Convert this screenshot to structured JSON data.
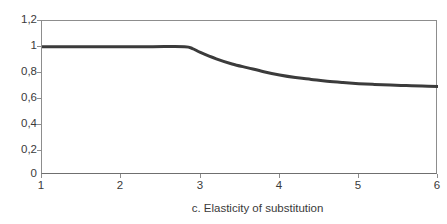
{
  "chart_data": {
    "type": "line",
    "title": "",
    "caption": "c. Elasticity of substitution",
    "xlabel": "c. Elasticity of substitution",
    "ylabel": "",
    "xlim": [
      1,
      6
    ],
    "ylim": [
      0,
      1.2
    ],
    "grid": false,
    "legend": null,
    "x_tick_labels": [
      "1",
      "2",
      "3",
      "4",
      "5",
      "6"
    ],
    "x_tick_values": [
      1,
      2,
      3,
      4,
      5,
      6
    ],
    "y_tick_labels": [
      "0",
      "0,2",
      "0,4",
      "0,6",
      "0,8",
      "1",
      "1,2"
    ],
    "y_tick_values": [
      0,
      0.2,
      0.4,
      0.6,
      0.8,
      1.0,
      1.2
    ],
    "decimal_separator": ",",
    "series": [
      {
        "name": "",
        "color": "#3b3b3b",
        "line_width": 3,
        "x": [
          1.0,
          1.5,
          2.0,
          2.4,
          2.8,
          2.9,
          3.0,
          3.2,
          3.4,
          3.6,
          3.8,
          4.0,
          4.2,
          4.4,
          4.6,
          4.8,
          5.0,
          5.2,
          5.4,
          5.6,
          5.8,
          6.0
        ],
        "values": [
          1.0,
          1.0,
          1.0,
          1.0,
          1.0,
          0.985,
          0.955,
          0.905,
          0.865,
          0.835,
          0.805,
          0.78,
          0.76,
          0.745,
          0.73,
          0.72,
          0.712,
          0.706,
          0.701,
          0.697,
          0.693,
          0.69
        ]
      }
    ],
    "kink_point": {
      "x": 2.8,
      "y": 1.0
    },
    "axis_color": "#8d8d8d",
    "text_color": "#3a3a3a",
    "background": "#ffffff"
  }
}
